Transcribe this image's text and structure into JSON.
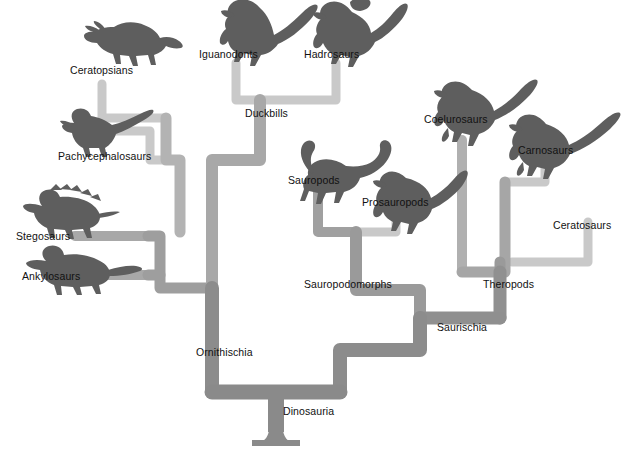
{
  "diagram": {
    "type": "cladogram",
    "root_label": "Dinosauria",
    "colors": {
      "trunk": "#8c8c8c",
      "branch_mid": "#a8a8a8",
      "branch_light": "#c9c9c9",
      "silhouette": "#5e5e5e",
      "text": "#111111",
      "background": "#ffffff"
    },
    "labels": {
      "dinosauria": "Dinosauria",
      "ornithischia": "Ornithischia",
      "saurischia": "Saurischia",
      "duckbills": "Duckbills",
      "ceratopsians": "Ceratopsians",
      "pachycephalosaurs": "Pachycephalosaurs",
      "stegosaurs": "Stegosaurs",
      "ankylosaurs": "Ankylosaurs",
      "iguanodonts": "Iguanodonts",
      "hadrosaurs": "Hadrosaurs",
      "sauropodomorphs": "Sauropodomorphs",
      "sauropods": "Sauropods",
      "prosauropods": "Prosauropods",
      "theropods": "Theropods",
      "coelurosaurs": "Coelurosaurs",
      "carnosaurs": "Carnosaurs",
      "ceratosaurs": "Ceratosaurs"
    },
    "silhouettes": [
      "ceratopsians-silhouette",
      "pachycephalosaurs-silhouette",
      "stegosaurs-silhouette",
      "ankylosaurs-silhouette",
      "iguanodonts-silhouette",
      "hadrosaurs-silhouette",
      "sauropods-silhouette",
      "prosauropods-silhouette",
      "coelurosaurs-silhouette",
      "carnosaurs-silhouette"
    ],
    "clades": [
      {
        "name": "Dinosauria",
        "parent": null
      },
      {
        "name": "Ornithischia",
        "parent": "Dinosauria"
      },
      {
        "name": "Saurischia",
        "parent": "Dinosauria"
      },
      {
        "name": "Duckbills",
        "parent": "Ornithischia"
      },
      {
        "name": "Iguanodonts",
        "parent": "Duckbills"
      },
      {
        "name": "Hadrosaurs",
        "parent": "Duckbills"
      },
      {
        "name": "Ceratopsians",
        "parent": "Ornithischia"
      },
      {
        "name": "Pachycephalosaurs",
        "parent": "Ornithischia"
      },
      {
        "name": "Stegosaurs",
        "parent": "Ornithischia"
      },
      {
        "name": "Ankylosaurs",
        "parent": "Ornithischia"
      },
      {
        "name": "Sauropodomorphs",
        "parent": "Saurischia"
      },
      {
        "name": "Sauropods",
        "parent": "Sauropodomorphs"
      },
      {
        "name": "Prosauropods",
        "parent": "Sauropodomorphs"
      },
      {
        "name": "Theropods",
        "parent": "Saurischia"
      },
      {
        "name": "Coelurosaurs",
        "parent": "Theropods"
      },
      {
        "name": "Carnosaurs",
        "parent": "Theropods"
      },
      {
        "name": "Ceratosaurs",
        "parent": "Theropods"
      }
    ]
  }
}
